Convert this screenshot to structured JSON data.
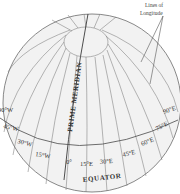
{
  "diagram": {
    "callout_label": {
      "line1": "Lines of",
      "line2": "Longitude"
    },
    "prime_meridian_label": "PRIME MERIDIAN",
    "equator_label": "EQUATOR",
    "longitude_labels": {
      "w90": "90°W",
      "w45": "45°W",
      "w30": "30°W",
      "w15": "15°W",
      "zero": "0°",
      "e15": "15°E",
      "e30": "30°E",
      "e45": "45°E",
      "e60": "60°E",
      "e75": "75°E",
      "e90": "90°E"
    },
    "colors": {
      "globe_fill": "#f2f2f2",
      "line": "#6b6b6b",
      "prime_meridian": "#3a3a3a",
      "text": "#333333"
    }
  }
}
